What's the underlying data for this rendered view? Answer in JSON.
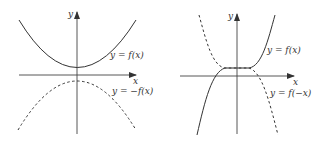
{
  "figure": {
    "left_panel": {
      "axis_x_label": "x",
      "axis_y_label": "y",
      "curves": [
        {
          "label": "y = f(x)",
          "style": "solid",
          "shape": "upward parabola, vertex above x-axis"
        },
        {
          "label": "y = −f(x)",
          "style": "dashed",
          "shape": "downward parabola, vertex below x-axis (reflection over x-axis)"
        }
      ]
    },
    "right_panel": {
      "axis_x_label": "x",
      "axis_y_label": "y",
      "curves": [
        {
          "label": "y = f(x)",
          "style": "solid",
          "shape": "increasing cubic with plateau above x-axis"
        },
        {
          "label": "y = f(−x)",
          "style": "dashed",
          "shape": "decreasing cubic (reflection over y-axis)"
        }
      ]
    },
    "colors": {
      "stroke": "#333333",
      "background": "#ffffff"
    }
  }
}
